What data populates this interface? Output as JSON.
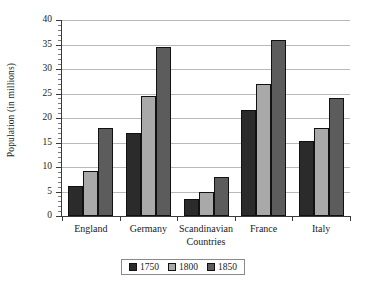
{
  "chart_data": {
    "type": "bar",
    "title": "",
    "subtitle": "",
    "xlabel": "",
    "ylabel": "Population (in millions)",
    "ylim": [
      0,
      40
    ],
    "ytick_step": 5,
    "ytick_labels": [
      "0",
      "5",
      "10",
      "15",
      "20",
      "25",
      "30",
      "35",
      "40"
    ],
    "ytick_values": [
      0,
      5,
      10,
      15,
      20,
      25,
      30,
      35,
      40
    ],
    "minor_ticks": true,
    "grid": "horizontal",
    "legend_position": "bottom-center",
    "categories": [
      "England",
      "Germany",
      "Scandinavian\nCountries",
      "France",
      "Italy"
    ],
    "series": [
      {
        "name": "1750",
        "color": "#2b2b2b",
        "values": [
          6.1,
          17.0,
          3.5,
          21.7,
          15.3
        ]
      },
      {
        "name": "1800",
        "color": "#a9a9a9",
        "values": [
          9.2,
          24.5,
          5.0,
          26.9,
          17.9
        ]
      },
      {
        "name": "1850",
        "color": "#5c5c5c",
        "values": [
          18.0,
          34.5,
          7.9,
          36.0,
          24.0
        ]
      }
    ]
  },
  "legend": {
    "entries": [
      {
        "label": "1750",
        "color": "#2b2b2b"
      },
      {
        "label": "1800",
        "color": "#a9a9a9"
      },
      {
        "label": "1850",
        "color": "#5c5c5c"
      }
    ]
  },
  "colors": {
    "background": "#ffffff",
    "axis": "#3a3a3a",
    "gridline": "#b9b9b9",
    "text": "#1a1a1a",
    "series_1750": "#2b2b2b",
    "series_1800": "#a9a9a9",
    "series_1850": "#5c5c5c"
  }
}
